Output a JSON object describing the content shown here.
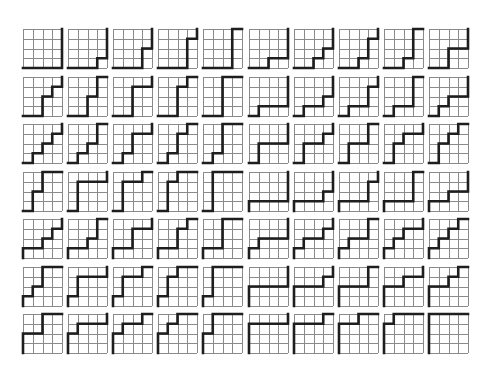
{
  "figure": {
    "grid_size": 4,
    "rows": 7,
    "columns": 10,
    "colors": {
      "background": "#ffffff",
      "grid": "#8a8a8a",
      "path": "#1e1e1e"
    }
  },
  "paths": [
    "RRRRUUUU",
    "RRRURUUU",
    "RRRUURUU",
    "RRRUUURU",
    "RRRUUUUR",
    "RRURRUUU",
    "RRURURUU",
    "RRURUURU",
    "RRURUUUR",
    "RRUURRUU",
    "RRUURURU",
    "RRUURUUR",
    "RRUUURRU",
    "RRUUURUR",
    "RRUUUURR",
    "RURRRUUU",
    "RURRURUU",
    "RURRUURU",
    "RURRUUUR",
    "RURURRUU",
    "RURURURU",
    "RURURUUR",
    "RURUURRU",
    "RURUURUR",
    "RURUUURR",
    "RUURRRUU",
    "RUURRURU",
    "RUURRUUR",
    "RUURURRU",
    "RUURURUR",
    "RUURUURR",
    "RUUURRRU",
    "RUUURRUR",
    "RUUURURR",
    "RUUUURRR",
    "URRRRUUU",
    "URRRURUU",
    "URRRUURU",
    "URRRUUUR",
    "URRURRUU",
    "URRURURU",
    "URRURUUR",
    "URRUURRU",
    "URRUURUR",
    "URRUUURR",
    "URURRRUU",
    "URURRURU",
    "URURRUUR",
    "URURURRU",
    "URURURUR",
    "URURUURR",
    "URUURRRU",
    "URUURRUR",
    "URUURURR",
    "URUUURRR",
    "UURRRRUU",
    "UURRRURU",
    "UURRRUUR",
    "UURRURRU",
    "UURRURUR",
    "UURRUURR",
    "UURURRRU",
    "UURURRUR",
    "UURURURR",
    "UURUURRR",
    "UUURRRRU",
    "UUURRRUR",
    "UUURRURR",
    "UUURURRR",
    "UUUURRRR"
  ]
}
